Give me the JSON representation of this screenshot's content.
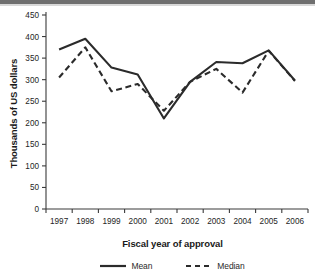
{
  "chart_data": {
    "type": "line",
    "title": "",
    "xlabel": "Fiscal year of approval",
    "ylabel": "Thousands of US dollars",
    "categories": [
      "1997",
      "1998",
      "1999",
      "2000",
      "2001",
      "2002",
      "2003",
      "2004",
      "2005",
      "2006"
    ],
    "x": [
      1997,
      1998,
      1999,
      2000,
      2001,
      2002,
      2003,
      2004,
      2005,
      2006
    ],
    "series": [
      {
        "name": "Mean",
        "style": "solid",
        "color": "#2b2b2b",
        "values": [
          370,
          395,
          328,
          312,
          210,
          295,
          341,
          338,
          368,
          298
        ]
      },
      {
        "name": "Median",
        "style": "dashed",
        "color": "#2b2b2b",
        "values": [
          305,
          375,
          273,
          290,
          228,
          295,
          325,
          270,
          367,
          297
        ]
      }
    ],
    "ylim": [
      0,
      450
    ],
    "yticks": [
      0,
      50,
      100,
      150,
      200,
      250,
      300,
      350,
      400,
      450
    ],
    "ytick_labels": [
      "0",
      "50",
      "100",
      "150",
      "200",
      "250",
      "300",
      "350",
      "400",
      "450"
    ],
    "xlim": [
      1996.6,
      2006.6
    ],
    "grid": false,
    "legend_position": "bottom",
    "legend_entries": [
      "Mean",
      "Median"
    ]
  },
  "legend": {
    "mean_label": "Mean",
    "median_label": "Median"
  },
  "axis": {
    "x_title": "Fiscal year of approval",
    "y_title": "Thousands of US dollars"
  },
  "colors": {
    "line": "#2b2b2b",
    "axis": "#3a3a3a",
    "text": "#252525",
    "top_strip": "#6f6f6f"
  }
}
